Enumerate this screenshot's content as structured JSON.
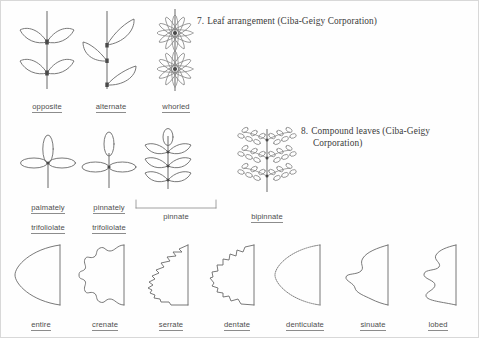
{
  "page": {
    "background": "#fefefe",
    "border_color": "#d8d8d8",
    "ink_color": "#6a6a6a"
  },
  "captions": [
    {
      "number": "7.",
      "line1": "Leaf arrangement (Ciba-Geigy Corporation)",
      "line2": ""
    },
    {
      "number": "8.",
      "line1": "Compound leaves (Ciba-Geigy",
      "line2": "Corporation)"
    }
  ],
  "rows": [
    {
      "name": "leaf-arrangement",
      "items": [
        {
          "id": "opposite",
          "label": "opposite",
          "label_line2": ""
        },
        {
          "id": "alternate",
          "label": "alternate",
          "label_line2": ""
        },
        {
          "id": "whorled",
          "label": "whorled",
          "label_line2": ""
        }
      ]
    },
    {
      "name": "compound-leaves",
      "items": [
        {
          "id": "palmately-trifoliolate",
          "label": "palmately",
          "label_line2": "trifoliolate"
        },
        {
          "id": "pinnately-trifoliolate",
          "label": "pinnately",
          "label_line2": "trifoliolate"
        },
        {
          "id": "pinnate",
          "label": "pinnate",
          "label_line2": ""
        },
        {
          "id": "bipinnate",
          "label": "bipinnate",
          "label_line2": ""
        }
      ]
    },
    {
      "name": "leaf-margins",
      "items": [
        {
          "id": "entire",
          "label": "entire",
          "label_line2": ""
        },
        {
          "id": "crenate",
          "label": "crenate",
          "label_line2": ""
        },
        {
          "id": "serrate",
          "label": "serrate",
          "label_line2": ""
        },
        {
          "id": "dentate",
          "label": "dentate",
          "label_line2": ""
        },
        {
          "id": "denticulate",
          "label": "denticulate",
          "label_line2": ""
        },
        {
          "id": "sinuate",
          "label": "sinuate",
          "label_line2": ""
        },
        {
          "id": "lobed",
          "label": "lobed",
          "label_line2": ""
        }
      ]
    }
  ]
}
